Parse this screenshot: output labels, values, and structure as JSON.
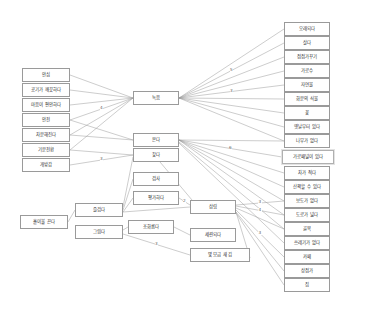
{
  "diagram": {
    "colors": {
      "node_border": "#9a9a9a",
      "node_fill": "#ffffff",
      "edge": "#9a9a9a",
      "text": "#2b2b2b",
      "label_text": "#5a5a5a"
    },
    "columns": {
      "left": {
        "name": "source-attributes",
        "nodes": [
          {
            "id": "n_ansim",
            "label": "안심",
            "x": 22,
            "y": 68,
            "w": 48,
            "h": 14
          },
          {
            "id": "n_air",
            "label": "공기가 깨끗하다",
            "x": 22,
            "y": 83,
            "w": 48,
            "h": 14
          },
          {
            "id": "n_mind",
            "label": "마음이 편안하다",
            "x": 22,
            "y": 98,
            "w": 48,
            "h": 14
          },
          {
            "id": "n_anjeon",
            "label": "안전",
            "x": 22,
            "y": 113,
            "w": 48,
            "h": 14
          },
          {
            "id": "n_chabun",
            "label": "차분해진다",
            "x": 22,
            "y": 128,
            "w": 48,
            "h": 14
          },
          {
            "id": "n_gibun",
            "label": "기분전환",
            "x": 22,
            "y": 143,
            "w": 48,
            "h": 14
          },
          {
            "id": "n_gaebang",
            "label": "개방감",
            "x": 22,
            "y": 158,
            "w": 48,
            "h": 14
          }
        ]
      },
      "lower_left": {
        "name": "lower-source-attributes",
        "nodes": [
          {
            "id": "n_honja",
            "label": "홀이불 끈다",
            "x": 20,
            "y": 215,
            "w": 48,
            "h": 14
          },
          {
            "id": "n_julgda",
            "label": "즐겁다",
            "x": 75,
            "y": 203,
            "w": 48,
            "h": 14
          },
          {
            "id": "n_geurida",
            "label": "그립다",
            "x": 75,
            "y": 225,
            "w": 48,
            "h": 14
          }
        ]
      },
      "middle": {
        "name": "verb-actions",
        "nodes": [
          {
            "id": "n_nokum",
            "label": "녹음",
            "x": 133,
            "y": 91,
            "w": 46,
            "h": 14
          },
          {
            "id": "n_bonda",
            "label": "본다",
            "x": 133,
            "y": 133,
            "w": 46,
            "h": 14
          },
          {
            "id": "n_chatda",
            "label": "찾다",
            "x": 133,
            "y": 148,
            "w": 46,
            "h": 14
          },
          {
            "id": "n_gumsa",
            "label": "검사",
            "x": 133,
            "y": 172,
            "w": 46,
            "h": 14
          },
          {
            "id": "n_pyeongga",
            "label": "평가하다",
            "x": 133,
            "y": 191,
            "w": 46,
            "h": 14
          },
          {
            "id": "n_johda",
            "label": "조화롭다",
            "x": 128,
            "y": 220,
            "w": 46,
            "h": 14
          }
        ]
      },
      "center_right": {
        "name": "mid-targets",
        "nodes": [
          {
            "id": "n_sanrim",
            "label": "삼림",
            "x": 190,
            "y": 200,
            "w": 46,
            "h": 14
          },
          {
            "id": "n_semyon",
            "label": "세련되다",
            "x": 190,
            "y": 228,
            "w": 46,
            "h": 14
          },
          {
            "id": "n_myeot",
            "label": "몇 모금 새 김",
            "x": 190,
            "y": 248,
            "w": 60,
            "h": 14
          }
        ]
      },
      "right": {
        "name": "target-attributes",
        "nodes": [
          {
            "id": "r1",
            "label": "오래되다",
            "x": 284,
            "y": 22,
            "w": 46,
            "h": 14
          },
          {
            "id": "r2",
            "label": "살다",
            "x": 284,
            "y": 36,
            "w": 46,
            "h": 14
          },
          {
            "id": "r3",
            "label": "점점가꾸기",
            "x": 284,
            "y": 50,
            "w": 46,
            "h": 14
          },
          {
            "id": "r4",
            "label": "가로수",
            "x": 284,
            "y": 64,
            "w": 46,
            "h": 14
          },
          {
            "id": "r5",
            "label": "자연물",
            "x": 284,
            "y": 78,
            "w": 46,
            "h": 14
          },
          {
            "id": "r6",
            "label": "화분의 식물",
            "x": 284,
            "y": 92,
            "w": 46,
            "h": 14
          },
          {
            "id": "r7",
            "label": "꽃",
            "x": 284,
            "y": 106,
            "w": 46,
            "h": 14
          },
          {
            "id": "r8",
            "label": "옛날부터 있다",
            "x": 284,
            "y": 120,
            "w": 46,
            "h": 14
          },
          {
            "id": "r9",
            "label": "나무가 없다",
            "x": 284,
            "y": 134,
            "w": 46,
            "h": 14
          },
          {
            "id": "r10",
            "label": "가로패널이 있다",
            "x": 282,
            "y": 150,
            "w": 52,
            "h": 14,
            "highlight": true
          },
          {
            "id": "r11",
            "label": "차가 적다",
            "x": 284,
            "y": 166,
            "w": 46,
            "h": 14
          },
          {
            "id": "r12",
            "label": "산책할 수 있다",
            "x": 284,
            "y": 180,
            "w": 46,
            "h": 14
          },
          {
            "id": "r13",
            "label": "보도가 없다",
            "x": 284,
            "y": 194,
            "w": 46,
            "h": 14
          },
          {
            "id": "r14",
            "label": "도로가 넓다",
            "x": 284,
            "y": 208,
            "w": 46,
            "h": 14
          },
          {
            "id": "r15",
            "label": "골목",
            "x": 284,
            "y": 222,
            "w": 46,
            "h": 14
          },
          {
            "id": "r16",
            "label": "쓰레기가 없다",
            "x": 284,
            "y": 236,
            "w": 46,
            "h": 14
          },
          {
            "id": "r17",
            "label": "카페",
            "x": 284,
            "y": 250,
            "w": 46,
            "h": 14
          },
          {
            "id": "r18",
            "label": "상점가",
            "x": 284,
            "y": 264,
            "w": 46,
            "h": 14
          },
          {
            "id": "r19",
            "label": "집",
            "x": 284,
            "y": 278,
            "w": 46,
            "h": 14
          }
        ]
      }
    },
    "edges": [
      {
        "from": "n_ansim",
        "to": "n_nokum",
        "x1": 70,
        "y1": 75,
        "x2": 133,
        "y2": 98
      },
      {
        "from": "n_air",
        "to": "n_nokum",
        "x1": 70,
        "y1": 90,
        "x2": 133,
        "y2": 98
      },
      {
        "from": "n_mind",
        "to": "n_nokum",
        "x1": 70,
        "y1": 105,
        "x2": 133,
        "y2": 98
      },
      {
        "from": "n_anjeon",
        "to": "n_nokum",
        "x1": 70,
        "y1": 120,
        "x2": 133,
        "y2": 98,
        "weight": "4"
      },
      {
        "from": "n_chabun",
        "to": "n_nokum",
        "x1": 70,
        "y1": 135,
        "x2": 133,
        "y2": 98
      },
      {
        "from": "n_gibun",
        "to": "n_nokum",
        "x1": 70,
        "y1": 150,
        "x2": 133,
        "y2": 98
      },
      {
        "from": "n_anjeon",
        "to": "n_bonda",
        "x1": 70,
        "y1": 120,
        "x2": 133,
        "y2": 140
      },
      {
        "from": "n_chabun",
        "to": "n_bonda",
        "x1": 70,
        "y1": 135,
        "x2": 133,
        "y2": 140
      },
      {
        "from": "n_gibun",
        "to": "n_chatda",
        "x1": 70,
        "y1": 150,
        "x2": 133,
        "y2": 155
      },
      {
        "from": "n_gaebang",
        "to": "n_chatda",
        "x1": 70,
        "y1": 165,
        "x2": 133,
        "y2": 155,
        "weight": "3"
      },
      {
        "from": "n_honja",
        "to": "n_julgda",
        "x1": 68,
        "y1": 222,
        "x2": 75,
        "y2": 210
      },
      {
        "from": "n_julgda",
        "to": "n_gumsa",
        "x1": 123,
        "y1": 210,
        "x2": 133,
        "y2": 179
      },
      {
        "from": "n_julgda",
        "to": "n_chatda",
        "x1": 123,
        "y1": 207,
        "x2": 133,
        "y2": 157
      },
      {
        "from": "n_julgda",
        "to": "n_pyeongga",
        "x1": 123,
        "y1": 212,
        "x2": 133,
        "y2": 198
      },
      {
        "from": "n_julgda",
        "to": "n_sanrim",
        "x1": 123,
        "y1": 212,
        "x2": 190,
        "y2": 207
      },
      {
        "from": "n_pyeongga",
        "to": "n_sanrim",
        "x1": 179,
        "y1": 198,
        "x2": 190,
        "y2": 205,
        "weight": "2"
      },
      {
        "from": "n_chatda",
        "to": "n_sanrim",
        "x1": 160,
        "y1": 162,
        "x2": 192,
        "y2": 200
      },
      {
        "from": "n_geurida",
        "to": "n_johda",
        "x1": 123,
        "y1": 230,
        "x2": 128,
        "y2": 227
      },
      {
        "from": "n_johda",
        "to": "n_semyon",
        "x1": 174,
        "y1": 227,
        "x2": 190,
        "y2": 235
      },
      {
        "from": "n_geurida",
        "to": "n_myeot",
        "x1": 123,
        "y1": 234,
        "x2": 190,
        "y2": 255,
        "weight": "3"
      },
      {
        "from": "n_myeot",
        "to": "n_sanrim",
        "x1": 250,
        "y1": 258,
        "x2": 236,
        "y2": 212
      },
      {
        "from": "r1",
        "to": "n_nokum",
        "x1": 284,
        "y1": 29,
        "x2": 179,
        "y2": 98
      },
      {
        "from": "r2",
        "to": "n_nokum",
        "x1": 284,
        "y1": 43,
        "x2": 179,
        "y2": 98,
        "weight": "5"
      },
      {
        "from": "r3",
        "to": "n_nokum",
        "x1": 284,
        "y1": 57,
        "x2": 179,
        "y2": 98
      },
      {
        "from": "r4",
        "to": "n_nokum",
        "x1": 284,
        "y1": 71,
        "x2": 179,
        "y2": 98
      },
      {
        "from": "r5",
        "to": "n_nokum",
        "x1": 284,
        "y1": 85,
        "x2": 179,
        "y2": 98,
        "weight": "3"
      },
      {
        "from": "r6",
        "to": "n_nokum",
        "x1": 284,
        "y1": 99,
        "x2": 179,
        "y2": 98
      },
      {
        "from": "r7",
        "to": "n_nokum",
        "x1": 284,
        "y1": 113,
        "x2": 179,
        "y2": 98
      },
      {
        "from": "r8",
        "to": "n_nokum",
        "x1": 284,
        "y1": 127,
        "x2": 179,
        "y2": 98
      },
      {
        "from": "r9",
        "to": "n_nokum",
        "x1": 284,
        "y1": 141,
        "x2": 179,
        "y2": 98
      },
      {
        "from": "r9",
        "to": "n_bonda",
        "x1": 284,
        "y1": 141,
        "x2": 179,
        "y2": 140
      },
      {
        "from": "r10",
        "to": "n_bonda",
        "x1": 282,
        "y1": 157,
        "x2": 179,
        "y2": 140,
        "weight": "6"
      },
      {
        "from": "r11",
        "to": "n_bonda",
        "x1": 284,
        "y1": 173,
        "x2": 179,
        "y2": 140
      },
      {
        "from": "r12",
        "to": "n_bonda",
        "x1": 284,
        "y1": 187,
        "x2": 179,
        "y2": 140
      },
      {
        "from": "r13",
        "to": "n_bonda",
        "x1": 284,
        "y1": 201,
        "x2": 179,
        "y2": 140
      },
      {
        "from": "r14",
        "to": "n_bonda",
        "x1": 284,
        "y1": 215,
        "x2": 179,
        "y2": 140
      },
      {
        "from": "r15",
        "to": "n_bonda",
        "x1": 284,
        "y1": 229,
        "x2": 179,
        "y2": 142
      },
      {
        "from": "r16",
        "to": "n_bonda",
        "x1": 284,
        "y1": 243,
        "x2": 179,
        "y2": 143
      },
      {
        "from": "r13",
        "to": "n_sanrim",
        "x1": 284,
        "y1": 201,
        "x2": 236,
        "y2": 205,
        "weight": "3"
      },
      {
        "from": "r14",
        "to": "n_sanrim",
        "x1": 284,
        "y1": 215,
        "x2": 236,
        "y2": 206,
        "weight": "4"
      },
      {
        "from": "r15",
        "to": "n_sanrim",
        "x1": 284,
        "y1": 229,
        "x2": 236,
        "y2": 208
      },
      {
        "from": "r17",
        "to": "n_sanrim",
        "x1": 284,
        "y1": 257,
        "x2": 236,
        "y2": 210,
        "weight": "3"
      },
      {
        "from": "r18",
        "to": "n_sanrim",
        "x1": 284,
        "y1": 271,
        "x2": 236,
        "y2": 212
      },
      {
        "from": "r19",
        "to": "n_sanrim",
        "x1": 284,
        "y1": 285,
        "x2": 236,
        "y2": 213
      }
    ]
  }
}
